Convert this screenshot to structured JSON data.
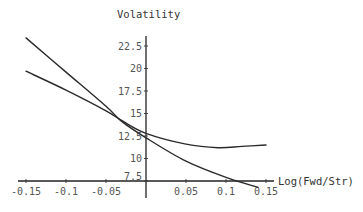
{
  "chart_data": {
    "type": "line",
    "title": "",
    "xlabel": "Log(Fwd/Str)",
    "ylabel": "Volatility",
    "xlim": [
      -0.15,
      0.15
    ],
    "ylim": [
      7.5,
      24
    ],
    "axes_origin": {
      "x": 0,
      "y": 7.5
    },
    "grid": false,
    "legend": "none",
    "x_ticks": [
      -0.15,
      -0.1,
      -0.05,
      0.05,
      0.1,
      0.15
    ],
    "x_tick_labels": [
      "-0.15",
      "-0.1",
      "-0.05",
      "0.05",
      "0.1",
      "0.15"
    ],
    "y_ticks": [
      7.5,
      10,
      12.5,
      15,
      17.5,
      20,
      22.5
    ],
    "y_tick_labels": [
      "7.5",
      "10",
      "12.5",
      "15",
      "17.5",
      "20",
      "22.5"
    ],
    "note": "Approximate values read off the plotted curves",
    "series": [
      {
        "name": "curve-steep",
        "x": [
          -0.15,
          -0.1,
          -0.05,
          -0.03,
          0,
          0.05,
          0.1,
          0.14
        ],
        "y": [
          23.4,
          19.6,
          15.8,
          14.1,
          12.3,
          9.7,
          7.9,
          6.8
        ]
      },
      {
        "name": "curve-flat",
        "x": [
          -0.15,
          -0.1,
          -0.05,
          -0.03,
          0,
          0.05,
          0.09,
          0.12,
          0.15
        ],
        "y": [
          19.7,
          17.6,
          15.3,
          14.2,
          12.8,
          11.6,
          11.2,
          11.35,
          11.5
        ]
      }
    ]
  }
}
